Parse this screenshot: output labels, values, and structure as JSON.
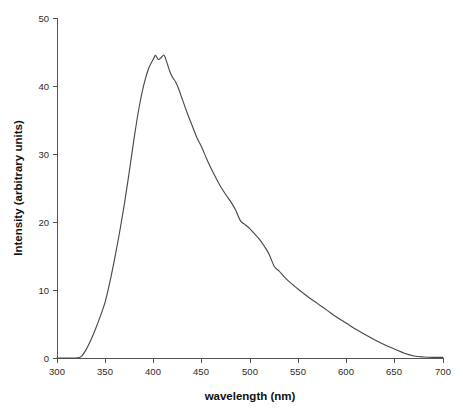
{
  "chart_data": {
    "type": "line",
    "title": "",
    "subtitle": "",
    "xlabel": "wavelength (nm)",
    "ylabel": "Intensity (arbitrary units)",
    "xlim": [
      300,
      700
    ],
    "ylim": [
      0,
      50
    ],
    "xticks": [
      300,
      350,
      400,
      450,
      500,
      550,
      600,
      650,
      700
    ],
    "xtick_labels": [
      "300",
      "350",
      "400",
      "450",
      "500",
      "550",
      "600",
      "650",
      "700"
    ],
    "yticks": [
      0,
      10,
      20,
      30,
      40,
      50
    ],
    "ytick_labels": [
      "0",
      "10",
      "20",
      "30",
      "40",
      "50"
    ],
    "grid": false,
    "legend": null,
    "legend_position": "none",
    "annotations": [],
    "series": [
      {
        "name": "emission spectrum",
        "color": "#4a4a4a",
        "x": [
          300,
          305,
          310,
          315,
          320,
          325,
          330,
          335,
          340,
          345,
          350,
          355,
          360,
          365,
          370,
          375,
          380,
          385,
          390,
          395,
          400,
          402,
          405,
          408,
          411,
          414,
          417,
          420,
          423,
          426,
          430,
          435,
          440,
          445,
          450,
          455,
          460,
          465,
          470,
          475,
          480,
          485,
          490,
          495,
          500,
          505,
          510,
          515,
          520,
          525,
          530,
          535,
          540,
          545,
          550,
          560,
          570,
          580,
          590,
          600,
          610,
          620,
          630,
          640,
          650,
          660,
          670,
          680,
          690,
          700
        ],
        "y": [
          0.0,
          0.0,
          0.0,
          0.0,
          0.0,
          0.2,
          1.2,
          2.6,
          4.3,
          6.2,
          8.3,
          11.3,
          14.8,
          18.6,
          22.8,
          27.5,
          32.4,
          36.8,
          40.2,
          42.6,
          44.0,
          44.5,
          43.9,
          44.2,
          44.5,
          43.4,
          42.1,
          41.2,
          40.6,
          39.6,
          38.0,
          36.0,
          34.2,
          32.4,
          31.0,
          29.3,
          27.8,
          26.4,
          25.1,
          24.0,
          23.0,
          21.8,
          20.2,
          19.6,
          19.0,
          18.2,
          17.4,
          16.4,
          15.2,
          13.5,
          12.8,
          12.0,
          11.3,
          10.7,
          10.1,
          9.0,
          8.0,
          7.0,
          6.0,
          5.1,
          4.2,
          3.4,
          2.6,
          1.9,
          1.3,
          0.7,
          0.3,
          0.15,
          0.1,
          0.1
        ]
      }
    ],
    "peaks": [
      {
        "x": 402,
        "y": 44.5
      },
      {
        "x": 411,
        "y": 44.5
      }
    ]
  },
  "axes": {
    "x_title": "wavelength (nm)",
    "y_title": "Intensity (arbitrary units)"
  }
}
